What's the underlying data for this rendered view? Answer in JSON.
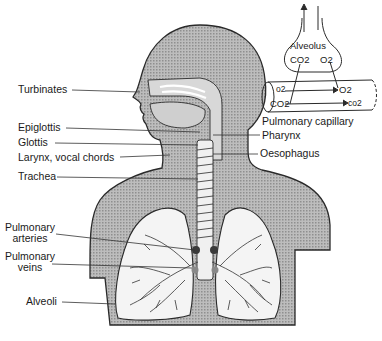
{
  "diagram": {
    "colors": {
      "body": "#b5b5b5",
      "outline": "#2a2a2a",
      "lung": "#f4f4f4",
      "line": "#333333"
    },
    "labels_left": [
      {
        "id": "turbinates",
        "text": "Turbinates"
      },
      {
        "id": "epiglottis",
        "text": "Epiglottis"
      },
      {
        "id": "glottis",
        "text": "Glottis"
      },
      {
        "id": "larynx",
        "text": "Larynx, vocal chords"
      },
      {
        "id": "trachea",
        "text": "Trachea"
      },
      {
        "id": "pulm_arteries_1",
        "text": "Pulmonary"
      },
      {
        "id": "pulm_arteries_2",
        "text": "arteries"
      },
      {
        "id": "pulm_veins_1",
        "text": "Pulmonary"
      },
      {
        "id": "pulm_veins_2",
        "text": "veins"
      },
      {
        "id": "alveoli",
        "text": "Alveoli"
      }
    ],
    "labels_right": [
      {
        "id": "pharynx",
        "text": "Pharynx"
      },
      {
        "id": "oesophagus",
        "text": "Oesophagus"
      }
    ],
    "inset": {
      "alveolus_label": "Alveolus",
      "co2_top": "CO2",
      "o2_top": "O2",
      "o2_in": "o2",
      "o2_out": "O2",
      "co2_in": "CO2",
      "co2_out": "co2",
      "capillary_label": "Pulmonary capillary"
    }
  }
}
